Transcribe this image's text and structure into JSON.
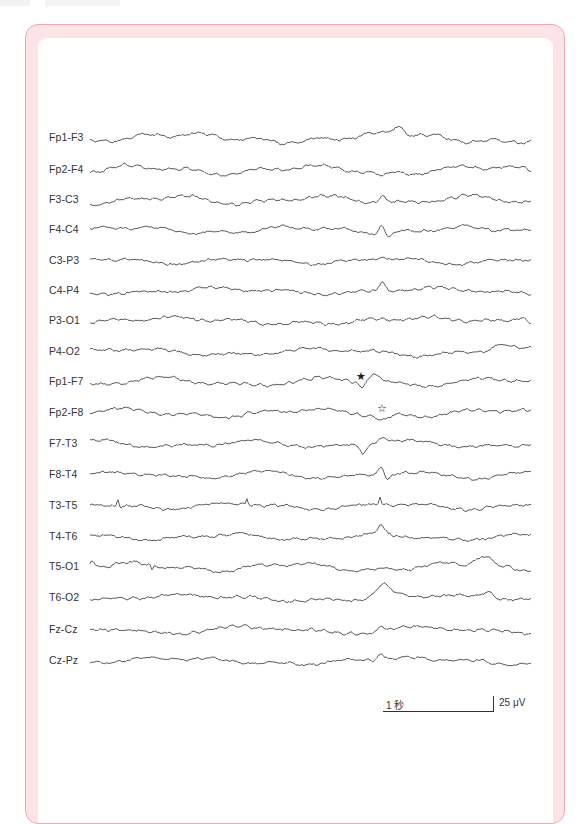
{
  "figure": {
    "type": "EEG montage (bipolar)",
    "trace_color": "#4a4a4a",
    "frame_color": "#f0a9b3",
    "frame_fill": "#fce3e7",
    "trace_x_start": 90,
    "trace_x_end": 531,
    "channels": [
      {
        "label": "Fp1-F3",
        "y": 138,
        "seed": 11,
        "amp": 4.0,
        "events": [
          {
            "x": 398,
            "h": -9,
            "w": 6
          }
        ]
      },
      {
        "label": "Fp2-F4",
        "y": 170,
        "seed": 23,
        "amp": 3.8,
        "events": [
          {
            "x": 383,
            "h": 4,
            "w": 5
          }
        ]
      },
      {
        "label": "F3-C3",
        "y": 200,
        "seed": 37,
        "amp": 3.6,
        "events": [
          {
            "x": 382,
            "h": -8,
            "w": 3
          }
        ]
      },
      {
        "label": "F4-C4",
        "y": 230,
        "seed": 41,
        "amp": 3.2,
        "events": [
          {
            "x": 382,
            "h": -9,
            "w": 3
          },
          {
            "x": 388,
            "h": 6,
            "w": 3
          }
        ]
      },
      {
        "label": "C3-P3",
        "y": 261,
        "seed": 53,
        "amp": 2.4,
        "events": [
          {
            "x": 381,
            "h": -4,
            "w": 3
          }
        ]
      },
      {
        "label": "C4-P4",
        "y": 291,
        "seed": 67,
        "amp": 2.6,
        "events": [
          {
            "x": 382,
            "h": -9,
            "w": 3
          }
        ]
      },
      {
        "label": "P3-O1",
        "y": 321,
        "seed": 71,
        "amp": 3.2,
        "events": [
          {
            "x": 522,
            "h": -6,
            "w": 8
          }
        ]
      },
      {
        "label": "P4-O2",
        "y": 352,
        "seed": 83,
        "amp": 3.2,
        "events": [
          {
            "x": 500,
            "h": -6,
            "w": 8
          }
        ]
      },
      {
        "label": "Fp1-F7",
        "y": 382,
        "seed": 97,
        "amp": 3.6,
        "events": [
          {
            "x": 362,
            "h": 6,
            "w": 3
          },
          {
            "x": 375,
            "h": -8,
            "w": 6
          }
        ]
      },
      {
        "label": "Fp2-F8",
        "y": 413,
        "seed": 101,
        "amp": 3.6,
        "events": [
          {
            "x": 383,
            "h": 6,
            "w": 5
          }
        ]
      },
      {
        "label": "F7-T3",
        "y": 444,
        "seed": 113,
        "amp": 3.0,
        "events": [
          {
            "x": 363,
            "h": 8,
            "w": 3
          },
          {
            "x": 383,
            "h": -7,
            "w": 4
          }
        ]
      },
      {
        "label": "F8-T4",
        "y": 475,
        "seed": 127,
        "amp": 3.0,
        "events": [
          {
            "x": 382,
            "h": -9,
            "w": 3
          },
          {
            "x": 387,
            "h": 7,
            "w": 3
          }
        ]
      },
      {
        "label": "T3-T5",
        "y": 506,
        "seed": 131,
        "amp": 2.8,
        "events": [
          {
            "x": 118,
            "h": -7,
            "w": 1
          },
          {
            "x": 247,
            "h": -6,
            "w": 1
          },
          {
            "x": 380,
            "h": -7,
            "w": 1
          }
        ]
      },
      {
        "label": "T4-T6",
        "y": 537,
        "seed": 149,
        "amp": 2.6,
        "events": [
          {
            "x": 381,
            "h": -9,
            "w": 3
          }
        ]
      },
      {
        "label": "T5-O1",
        "y": 567,
        "seed": 151,
        "amp": 3.6,
        "events": [
          {
            "x": 92,
            "h": -8,
            "w": 2
          },
          {
            "x": 152,
            "h": 6,
            "w": 1
          },
          {
            "x": 483,
            "h": -10,
            "w": 8
          }
        ]
      },
      {
        "label": "T6-O2",
        "y": 598,
        "seed": 163,
        "amp": 2.8,
        "events": [
          {
            "x": 383,
            "h": -12,
            "w": 7
          },
          {
            "x": 488,
            "h": -6,
            "w": 7
          }
        ]
      },
      {
        "label": "Fz-Cz",
        "y": 630,
        "seed": 173,
        "amp": 3.2,
        "events": [
          {
            "x": 381,
            "h": -5,
            "w": 3
          }
        ]
      },
      {
        "label": "Cz-Pz",
        "y": 661,
        "seed": 181,
        "amp": 3.0,
        "events": [
          {
            "x": 380,
            "h": -6,
            "w": 3
          }
        ]
      }
    ],
    "markers": [
      {
        "glyph": "★",
        "name": "filled-star-marker",
        "x": 356,
        "y": 371
      },
      {
        "glyph": "☆",
        "name": "outline-star-marker",
        "x": 377,
        "y": 403
      }
    ],
    "scale_bar": {
      "time_label": "1 秒",
      "amplitude_label": "25 μV"
    }
  }
}
